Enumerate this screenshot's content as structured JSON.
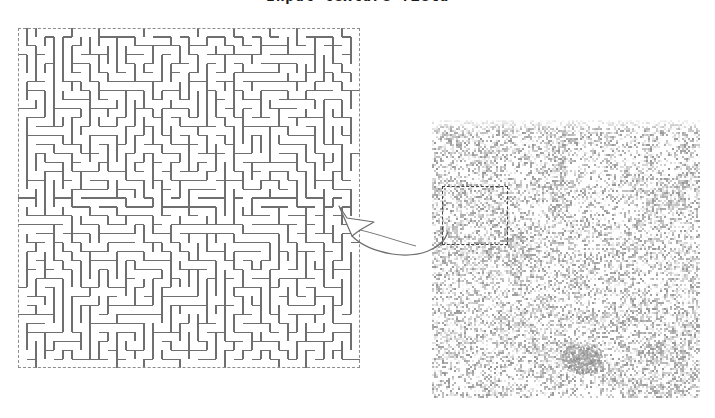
{
  "figure": {
    "title": "Input texture field",
    "width": 715,
    "height": 418,
    "background_color": "#ffffff"
  },
  "maze_panel": {
    "label": "maze-pattern",
    "x": 18,
    "y": 28,
    "width": 342,
    "height": 340,
    "border_style": "dashed",
    "border_color": "#8d8d8d",
    "wall_color": "#6f6f6f",
    "wall_width": 1.1,
    "cell_size": 9,
    "cols": 38,
    "rows": 38,
    "seed": 20240517
  },
  "texture_panel": {
    "label": "noise-texture",
    "x": 432,
    "y": 120,
    "width": 268,
    "height": 278,
    "noise_type": "grayscale-speckle",
    "noise_cell": 2,
    "base_color": "#ffffff",
    "ink_color": "#9a9a9a",
    "density": 0.55,
    "seed": 7731,
    "selection": {
      "label": "crop-region",
      "x": 10,
      "y": 66,
      "width": 66,
      "height": 59,
      "border_style": "dashed",
      "border_color": "#404040"
    }
  },
  "arrow": {
    "label": "zoom-callout-arrow",
    "x": 330,
    "y": 188,
    "width": 130,
    "height": 78,
    "stroke_color": "#6b6b6b",
    "fill_color": "#ffffff",
    "direction": "right-to-left",
    "style": "curved-hollow"
  },
  "chart_data": {
    "type": "image",
    "title": "Input texture field",
    "panels": [
      {
        "name": "maze-pattern",
        "role": "zoomed-detail",
        "position": "left"
      },
      {
        "name": "noise-texture",
        "role": "source-field",
        "position": "right"
      }
    ],
    "annotations": [
      {
        "type": "dashed-rect",
        "on": "noise-texture",
        "meaning": "crop-region"
      },
      {
        "type": "curved-arrow",
        "from": "crop-region",
        "to": "maze-pattern"
      }
    ]
  }
}
